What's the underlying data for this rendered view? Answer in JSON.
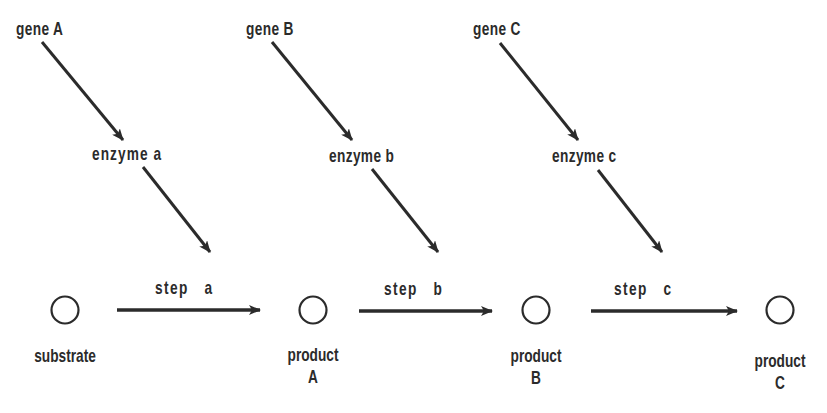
{
  "diagram": {
    "type": "metabolic-pathway",
    "colors": {
      "ink": "#2b2b2b",
      "background": "#ffffff"
    },
    "genes": [
      {
        "label": "gene A"
      },
      {
        "label": "gene B"
      },
      {
        "label": "gene C"
      }
    ],
    "enzymes": [
      {
        "label": "enzyme a"
      },
      {
        "label": "enzyme b"
      },
      {
        "label": "enzyme c"
      }
    ],
    "steps": [
      {
        "label": "step   a"
      },
      {
        "label": "step   b"
      },
      {
        "label": "step   c"
      }
    ],
    "nodes": [
      {
        "line1": "substrate",
        "line2": ""
      },
      {
        "line1": "product",
        "line2": "A"
      },
      {
        "line1": "product",
        "line2": "B"
      },
      {
        "line1": "product",
        "line2": "C"
      }
    ],
    "edges": [
      {
        "from": "gene A",
        "to": "enzyme a"
      },
      {
        "from": "enzyme a",
        "to": "step a"
      },
      {
        "from": "gene B",
        "to": "enzyme b"
      },
      {
        "from": "enzyme b",
        "to": "step b"
      },
      {
        "from": "gene C",
        "to": "enzyme c"
      },
      {
        "from": "enzyme c",
        "to": "step c"
      },
      {
        "from": "substrate",
        "to": "product A",
        "label": "step a"
      },
      {
        "from": "product A",
        "to": "product B",
        "label": "step b"
      },
      {
        "from": "product B",
        "to": "product C",
        "label": "step c"
      }
    ]
  }
}
